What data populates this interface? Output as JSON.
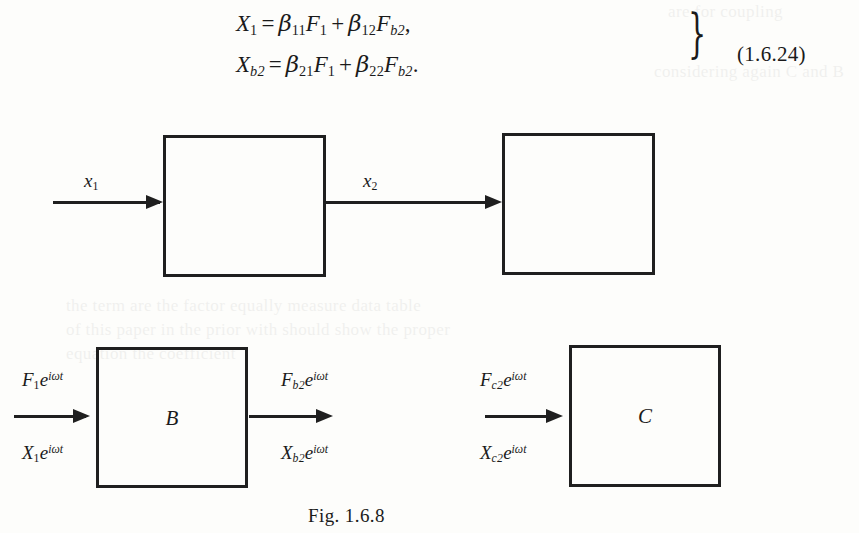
{
  "document": {
    "figure_caption": "Fig. 1.6.8"
  },
  "equation": {
    "number": "(1.6.24)",
    "lines": [
      {
        "lhs_var": "X",
        "lhs_sub": "1",
        "equals": "=",
        "t1_coef": "β",
        "t1_coef_sub": "11",
        "t1_var": "F",
        "t1_var_sub": "1",
        "plus": "+",
        "t2_coef": "β",
        "t2_coef_sub": "12",
        "t2_var": "F",
        "t2_var_sub": "b2",
        "terminator": ","
      },
      {
        "lhs_var": "X",
        "lhs_sub": "b2",
        "equals": "=",
        "t1_coef": "β",
        "t1_coef_sub": "21",
        "t1_var": "F",
        "t1_var_sub": "1",
        "plus": "+",
        "t2_coef": "β",
        "t2_coef_sub": "22",
        "t2_var": "F",
        "t2_var_sub": "b2",
        "terminator": "."
      }
    ],
    "brace": "}"
  },
  "diagram_top": {
    "boxes": [
      {
        "id": "box-1",
        "label": ""
      },
      {
        "id": "box-2",
        "label": ""
      }
    ],
    "signals": [
      {
        "id": "signal-x1",
        "var": "x",
        "sub": "1"
      },
      {
        "id": "signal-x2",
        "var": "x",
        "sub": "2"
      }
    ]
  },
  "diagram_bottom": {
    "boxes": [
      {
        "id": "box-b",
        "label": "B"
      },
      {
        "id": "box-c",
        "label": "C"
      }
    ],
    "signals": [
      {
        "id": "signal-b-input",
        "force": {
          "var": "F",
          "sub": "1",
          "exp_base": "e",
          "exp": "iωt"
        },
        "displacement": {
          "var": "X",
          "sub": "1",
          "exp_base": "e",
          "exp": "iωt"
        }
      },
      {
        "id": "signal-b-output",
        "force": {
          "var": "F",
          "sub": "b2",
          "exp_base": "e",
          "exp": "iωt"
        },
        "displacement": {
          "var": "X",
          "sub": "b2",
          "exp_base": "e",
          "exp": "iωt"
        }
      },
      {
        "id": "signal-c-input",
        "force": {
          "var": "F",
          "sub": "c2",
          "exp_base": "e",
          "exp": "iωt"
        },
        "displacement": {
          "var": "X",
          "sub": "c2",
          "exp_base": "e",
          "exp": "iωt"
        }
      }
    ]
  },
  "ghost_text": {
    "top_right": "are for coupling",
    "second_right": "considering again C and B",
    "mid_left": "the term are the factor equally measure data table",
    "mid_left2": "of this paper in the prior with should show the proper",
    "mid_left3": "equation the coefficient"
  },
  "colors": {
    "ink": "#1f1f1f",
    "paper": "#fdfdfb"
  }
}
